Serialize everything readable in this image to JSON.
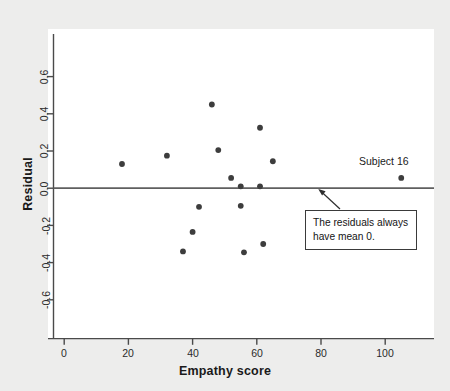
{
  "chart_data": {
    "type": "scatter",
    "title": "",
    "xlabel": "Empathy score",
    "ylabel": "Residual",
    "xlim": [
      -4,
      115
    ],
    "ylim": [
      -0.75,
      0.73
    ],
    "xticks": [
      0,
      20,
      40,
      60,
      80,
      100
    ],
    "yticks": [
      0.6,
      0.4,
      0.2,
      0.0,
      -0.2,
      -0.4,
      -0.6
    ],
    "xtick_labels": [
      "0",
      "20",
      "40",
      "60",
      "80",
      "100"
    ],
    "ytick_labels": [
      "0.6",
      "0.4",
      "0.2",
      "0.0",
      "-0.2",
      "-0.4",
      "-0.6"
    ],
    "grid": false,
    "legend": false,
    "reference_line": {
      "orientation": "horizontal",
      "y": 0.0,
      "label": "residual mean zero line",
      "color": "#5a5a5a"
    },
    "points": [
      {
        "x": 18,
        "y": 0.13
      },
      {
        "x": 32,
        "y": 0.175
      },
      {
        "x": 46,
        "y": 0.45
      },
      {
        "x": 48,
        "y": 0.205
      },
      {
        "x": 52,
        "y": 0.055
      },
      {
        "x": 55,
        "y": 0.01
      },
      {
        "x": 61,
        "y": 0.325
      },
      {
        "x": 61,
        "y": 0.01
      },
      {
        "x": 65,
        "y": 0.145
      },
      {
        "x": 105,
        "y": 0.055
      },
      {
        "x": 42,
        "y": -0.1
      },
      {
        "x": 55,
        "y": -0.095
      },
      {
        "x": 40,
        "y": -0.235
      },
      {
        "x": 37,
        "y": -0.34
      },
      {
        "x": 56,
        "y": -0.345
      },
      {
        "x": 62,
        "y": -0.3
      }
    ],
    "marker_color": "#3d3d3d",
    "marker_size": 4,
    "annotations": [
      {
        "name": "subject-16-label",
        "text": "Subject 16",
        "x": 98,
        "y": 0.135
      },
      {
        "name": "mean-zero-callout",
        "lines": [
          "The residuals always",
          "have mean 0."
        ],
        "arrow_from": {
          "x": 92,
          "y": -0.115
        },
        "arrow_to": {
          "x": 86,
          "y": -0.01
        }
      }
    ]
  },
  "figure": {
    "background_color": "#ededec",
    "plot_background_color": "#ffffff",
    "axis_color": "#444444"
  }
}
